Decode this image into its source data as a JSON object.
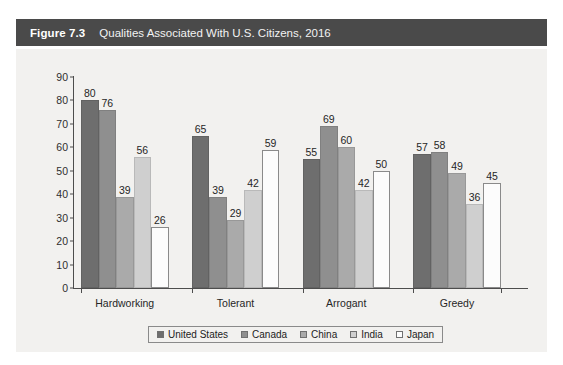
{
  "figure": {
    "number": "Figure 7.3",
    "title": "Qualities Associated With U.S. Citizens, 2016"
  },
  "legend": {
    "position": "bottom",
    "items": [
      {
        "label": "United States",
        "color": "#6e6e6e"
      },
      {
        "label": "Canada",
        "color": "#8f8f8f"
      },
      {
        "label": "China",
        "color": "#aaaaaa"
      },
      {
        "label": "India",
        "color": "#cfcfcf"
      },
      {
        "label": "Japan",
        "color": "#fcfcfc"
      }
    ]
  },
  "chart_data": {
    "type": "bar",
    "title": "Qualities Associated With U.S. Citizens, 2016",
    "xlabel": "",
    "ylabel": "",
    "ylim": [
      0,
      90
    ],
    "yticks": [
      0,
      10,
      20,
      30,
      40,
      50,
      60,
      70,
      80,
      90
    ],
    "grid": false,
    "legend_position": "bottom",
    "categories": [
      "Hardworking",
      "Tolerant",
      "Arrogant",
      "Greedy"
    ],
    "series": [
      {
        "name": "United States",
        "color": "#6e6e6e",
        "values": [
          80,
          65,
          55,
          57
        ]
      },
      {
        "name": "Canada",
        "color": "#8f8f8f",
        "values": [
          76,
          39,
          69,
          58
        ]
      },
      {
        "name": "China",
        "color": "#aaaaaa",
        "values": [
          39,
          29,
          60,
          49
        ]
      },
      {
        "name": "India",
        "color": "#cfcfcf",
        "values": [
          56,
          42,
          42,
          36
        ]
      },
      {
        "name": "Japan",
        "color": "#fcfcfc",
        "values": [
          26,
          59,
          50,
          45
        ]
      }
    ]
  }
}
